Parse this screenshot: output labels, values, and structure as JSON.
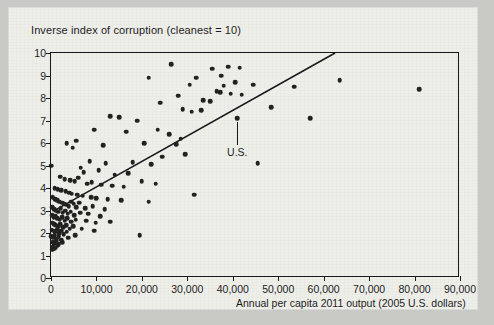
{
  "figure": {
    "title": "Inverse index of corruption (cleanest = 10)",
    "xlabel": "Annual per capita 2011 output (2005 U.S. dollars)",
    "annotation_label": "U.S.",
    "colors": {
      "ink": "#20201f",
      "paper": "#efefea",
      "border": "#c9c9c5"
    }
  },
  "chart_data": {
    "type": "scatter",
    "title": "Inverse index of corruption (cleanest = 10)",
    "xlabel": "Annual per capita 2011 output (2005 U.S. dollars)",
    "ylabel": "Inverse index of corruption (cleanest = 10)",
    "xlim": [
      0,
      90000
    ],
    "ylim": [
      0,
      10
    ],
    "grid": false,
    "legend": null,
    "xticks": [
      0,
      10000,
      20000,
      30000,
      40000,
      50000,
      60000,
      70000,
      80000,
      90000
    ],
    "xticklabels": [
      "0",
      "10,000",
      "20,000",
      "30,000",
      "40,000",
      "50,000",
      "60,000",
      "70,000",
      "80,000",
      "90,000"
    ],
    "yticks": [
      0,
      1,
      2,
      3,
      4,
      5,
      6,
      7,
      8,
      9,
      10
    ],
    "yticklabels": [
      "0",
      "1",
      "2",
      "3",
      "4",
      "5",
      "6",
      "7",
      "8",
      "9",
      "10"
    ],
    "annotations": [
      {
        "text": "U.S.",
        "x": 41000,
        "y": 7.1,
        "label_y": 5.85
      }
    ],
    "trendline": {
      "x": [
        1200,
        62500
      ],
      "y": [
        3.05,
        10.0
      ]
    },
    "points": [
      {
        "x": 26500,
        "y": 9.5
      },
      {
        "x": 35500,
        "y": 9.3
      },
      {
        "x": 39000,
        "y": 9.4
      },
      {
        "x": 41500,
        "y": 9.35
      },
      {
        "x": 32000,
        "y": 8.9
      },
      {
        "x": 37500,
        "y": 9.0
      },
      {
        "x": 40500,
        "y": 8.7
      },
      {
        "x": 44500,
        "y": 8.6
      },
      {
        "x": 38000,
        "y": 8.55
      },
      {
        "x": 36500,
        "y": 8.3
      },
      {
        "x": 37200,
        "y": 8.25
      },
      {
        "x": 39500,
        "y": 8.2
      },
      {
        "x": 42000,
        "y": 8.15
      },
      {
        "x": 30500,
        "y": 8.6
      },
      {
        "x": 28000,
        "y": 8.1
      },
      {
        "x": 63500,
        "y": 8.8
      },
      {
        "x": 81000,
        "y": 8.4
      },
      {
        "x": 53500,
        "y": 8.5
      },
      {
        "x": 21500,
        "y": 8.9
      },
      {
        "x": 24000,
        "y": 7.8
      },
      {
        "x": 33500,
        "y": 7.9
      },
      {
        "x": 35000,
        "y": 7.85
      },
      {
        "x": 29000,
        "y": 7.5
      },
      {
        "x": 31000,
        "y": 7.4
      },
      {
        "x": 33000,
        "y": 7.45
      },
      {
        "x": 41000,
        "y": 7.1
      },
      {
        "x": 48500,
        "y": 7.6
      },
      {
        "x": 57000,
        "y": 7.1
      },
      {
        "x": 13000,
        "y": 7.2
      },
      {
        "x": 15000,
        "y": 7.15
      },
      {
        "x": 19000,
        "y": 7.0
      },
      {
        "x": 9500,
        "y": 6.6
      },
      {
        "x": 16500,
        "y": 6.5
      },
      {
        "x": 23500,
        "y": 6.6
      },
      {
        "x": 26000,
        "y": 6.4
      },
      {
        "x": 28500,
        "y": 6.2
      },
      {
        "x": 3500,
        "y": 6.0
      },
      {
        "x": 4800,
        "y": 5.8
      },
      {
        "x": 5500,
        "y": 6.1
      },
      {
        "x": 11500,
        "y": 5.9
      },
      {
        "x": 20500,
        "y": 6.0
      },
      {
        "x": 27500,
        "y": 5.95
      },
      {
        "x": 29500,
        "y": 5.5
      },
      {
        "x": 24500,
        "y": 5.4
      },
      {
        "x": 0,
        "y": 5.0
      },
      {
        "x": 8500,
        "y": 5.2
      },
      {
        "x": 12000,
        "y": 5.1
      },
      {
        "x": 18000,
        "y": 5.15
      },
      {
        "x": 22000,
        "y": 5.05
      },
      {
        "x": 45500,
        "y": 5.1
      },
      {
        "x": 6500,
        "y": 4.9
      },
      {
        "x": 7200,
        "y": 4.7
      },
      {
        "x": 10500,
        "y": 4.8
      },
      {
        "x": 14000,
        "y": 4.6
      },
      {
        "x": 17000,
        "y": 4.65
      },
      {
        "x": 2000,
        "y": 4.5
      },
      {
        "x": 3000,
        "y": 4.4
      },
      {
        "x": 4200,
        "y": 4.35
      },
      {
        "x": 5200,
        "y": 4.3
      },
      {
        "x": 6000,
        "y": 4.45
      },
      {
        "x": 8000,
        "y": 4.2
      },
      {
        "x": 9000,
        "y": 4.25
      },
      {
        "x": 11000,
        "y": 4.15
      },
      {
        "x": 13500,
        "y": 4.1
      },
      {
        "x": 16000,
        "y": 4.05
      },
      {
        "x": 20000,
        "y": 4.3
      },
      {
        "x": 23000,
        "y": 4.2
      },
      {
        "x": 31500,
        "y": 3.7
      },
      {
        "x": 800,
        "y": 4.0
      },
      {
        "x": 1500,
        "y": 3.95
      },
      {
        "x": 2300,
        "y": 3.9
      },
      {
        "x": 3200,
        "y": 3.85
      },
      {
        "x": 4000,
        "y": 3.8
      },
      {
        "x": 4600,
        "y": 3.75
      },
      {
        "x": 5800,
        "y": 3.7
      },
      {
        "x": 7000,
        "y": 3.65
      },
      {
        "x": 8800,
        "y": 3.6
      },
      {
        "x": 10000,
        "y": 3.55
      },
      {
        "x": 12500,
        "y": 3.5
      },
      {
        "x": 15500,
        "y": 3.45
      },
      {
        "x": 400,
        "y": 3.6
      },
      {
        "x": 900,
        "y": 3.5
      },
      {
        "x": 1300,
        "y": 3.45
      },
      {
        "x": 1800,
        "y": 3.4
      },
      {
        "x": 2400,
        "y": 3.35
      },
      {
        "x": 2900,
        "y": 3.3
      },
      {
        "x": 3400,
        "y": 3.25
      },
      {
        "x": 3900,
        "y": 3.2
      },
      {
        "x": 4400,
        "y": 3.4
      },
      {
        "x": 5000,
        "y": 3.3
      },
      {
        "x": 5600,
        "y": 3.15
      },
      {
        "x": 6200,
        "y": 3.35
      },
      {
        "x": 7500,
        "y": 3.1
      },
      {
        "x": 9200,
        "y": 3.2
      },
      {
        "x": 11800,
        "y": 3.05
      },
      {
        "x": 300,
        "y": 3.15
      },
      {
        "x": 700,
        "y": 3.05
      },
      {
        "x": 1100,
        "y": 3.0
      },
      {
        "x": 1600,
        "y": 2.95
      },
      {
        "x": 2100,
        "y": 3.1
      },
      {
        "x": 2600,
        "y": 2.9
      },
      {
        "x": 3100,
        "y": 3.0
      },
      {
        "x": 3700,
        "y": 2.85
      },
      {
        "x": 4300,
        "y": 2.95
      },
      {
        "x": 5100,
        "y": 2.8
      },
      {
        "x": 6400,
        "y": 2.9
      },
      {
        "x": 8200,
        "y": 2.85
      },
      {
        "x": 10800,
        "y": 2.75
      },
      {
        "x": 200,
        "y": 2.8
      },
      {
        "x": 600,
        "y": 2.7
      },
      {
        "x": 1000,
        "y": 2.75
      },
      {
        "x": 1400,
        "y": 2.65
      },
      {
        "x": 1900,
        "y": 2.6
      },
      {
        "x": 2500,
        "y": 2.7
      },
      {
        "x": 3000,
        "y": 2.55
      },
      {
        "x": 3600,
        "y": 2.65
      },
      {
        "x": 4500,
        "y": 2.5
      },
      {
        "x": 5400,
        "y": 2.6
      },
      {
        "x": 7800,
        "y": 2.55
      },
      {
        "x": 9800,
        "y": 2.45
      },
      {
        "x": 13000,
        "y": 2.5
      },
      {
        "x": 21500,
        "y": 3.4
      },
      {
        "x": 250,
        "y": 2.45
      },
      {
        "x": 650,
        "y": 2.4
      },
      {
        "x": 1050,
        "y": 2.35
      },
      {
        "x": 1550,
        "y": 2.3
      },
      {
        "x": 2000,
        "y": 2.4
      },
      {
        "x": 2700,
        "y": 2.25
      },
      {
        "x": 3300,
        "y": 2.35
      },
      {
        "x": 4100,
        "y": 2.2
      },
      {
        "x": 4900,
        "y": 2.3
      },
      {
        "x": 6800,
        "y": 2.2
      },
      {
        "x": 150,
        "y": 2.15
      },
      {
        "x": 550,
        "y": 2.1
      },
      {
        "x": 950,
        "y": 2.05
      },
      {
        "x": 1350,
        "y": 2.15
      },
      {
        "x": 1750,
        "y": 2.0
      },
      {
        "x": 2200,
        "y": 2.1
      },
      {
        "x": 2800,
        "y": 1.95
      },
      {
        "x": 3500,
        "y": 2.05
      },
      {
        "x": 5300,
        "y": 1.9
      },
      {
        "x": 9500,
        "y": 2.1
      },
      {
        "x": 19500,
        "y": 1.9
      },
      {
        "x": 100,
        "y": 1.85
      },
      {
        "x": 500,
        "y": 1.8
      },
      {
        "x": 850,
        "y": 1.9
      },
      {
        "x": 1250,
        "y": 1.75
      },
      {
        "x": 1700,
        "y": 1.85
      },
      {
        "x": 2300,
        "y": 1.7
      },
      {
        "x": 3800,
        "y": 1.8
      },
      {
        "x": 350,
        "y": 1.6
      },
      {
        "x": 750,
        "y": 1.55
      },
      {
        "x": 1150,
        "y": 1.65
      },
      {
        "x": 1600,
        "y": 1.5
      },
      {
        "x": 2400,
        "y": 1.6
      },
      {
        "x": 450,
        "y": 1.4
      },
      {
        "x": 1000,
        "y": 1.35
      },
      {
        "x": 1450,
        "y": 1.45
      },
      {
        "x": 300,
        "y": 1.25
      },
      {
        "x": 820,
        "y": 1.3
      }
    ]
  }
}
